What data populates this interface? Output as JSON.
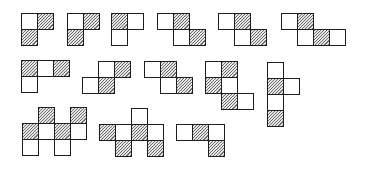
{
  "figure": {
    "cell_size": 16,
    "colors": {
      "outline": "#1e1e1e",
      "white_cell": "#ffffff",
      "hatch": "#6f6f6f"
    },
    "shapes": [
      {
        "id": 1,
        "x": 21,
        "y": 13,
        "cells": [
          {
            "c": 0,
            "r": 0,
            "h": false
          },
          {
            "c": 1,
            "r": 0,
            "h": true
          },
          {
            "c": 0,
            "r": 1,
            "h": true
          }
        ]
      },
      {
        "id": 2,
        "x": 67,
        "y": 13,
        "cells": [
          {
            "c": 0,
            "r": 0,
            "h": false
          },
          {
            "c": 1,
            "r": 0,
            "h": true
          },
          {
            "c": 0,
            "r": 1,
            "h": true
          }
        ]
      },
      {
        "id": 3,
        "x": 111,
        "y": 13,
        "cells": [
          {
            "c": 0,
            "r": 0,
            "h": true
          },
          {
            "c": 1,
            "r": 0,
            "h": false
          },
          {
            "c": 0,
            "r": 1,
            "h": false
          }
        ]
      },
      {
        "id": 4,
        "x": 157,
        "y": 13,
        "cells": [
          {
            "c": 0,
            "r": 0,
            "h": false
          },
          {
            "c": 1,
            "r": 0,
            "h": true
          },
          {
            "c": 1,
            "r": 1,
            "h": false
          },
          {
            "c": 2,
            "r": 1,
            "h": true
          }
        ]
      },
      {
        "id": 5,
        "x": 218,
        "y": 13,
        "cells": [
          {
            "c": 0,
            "r": 0,
            "h": false
          },
          {
            "c": 1,
            "r": 0,
            "h": true
          },
          {
            "c": 1,
            "r": 1,
            "h": false
          },
          {
            "c": 2,
            "r": 1,
            "h": true
          }
        ]
      },
      {
        "id": 6,
        "x": 281,
        "y": 13,
        "cells": [
          {
            "c": 0,
            "r": 0,
            "h": false
          },
          {
            "c": 1,
            "r": 0,
            "h": true
          },
          {
            "c": 1,
            "r": 1,
            "h": false
          },
          {
            "c": 2,
            "r": 1,
            "h": true
          },
          {
            "c": 3,
            "r": 1,
            "h": false
          }
        ]
      },
      {
        "id": 7,
        "x": 21,
        "y": 60,
        "cells": [
          {
            "c": 0,
            "r": 0,
            "h": true
          },
          {
            "c": 1,
            "r": 0,
            "h": false
          },
          {
            "c": 2,
            "r": 0,
            "h": true
          },
          {
            "c": 0,
            "r": 1,
            "h": false
          }
        ]
      },
      {
        "id": 8,
        "x": 82,
        "y": 61,
        "cells": [
          {
            "c": 1,
            "r": 0,
            "h": false
          },
          {
            "c": 2,
            "r": 0,
            "h": true
          },
          {
            "c": 0,
            "r": 1,
            "h": false
          },
          {
            "c": 1,
            "r": 1,
            "h": true
          }
        ]
      },
      {
        "id": 9,
        "x": 144,
        "y": 61,
        "cells": [
          {
            "c": 0,
            "r": 0,
            "h": false
          },
          {
            "c": 1,
            "r": 0,
            "h": true
          },
          {
            "c": 1,
            "r": 1,
            "h": false
          },
          {
            "c": 2,
            "r": 1,
            "h": true
          }
        ]
      },
      {
        "id": 10,
        "x": 205,
        "y": 61,
        "cells": [
          {
            "c": 0,
            "r": 0,
            "h": false
          },
          {
            "c": 1,
            "r": 0,
            "h": true
          },
          {
            "c": 0,
            "r": 1,
            "h": true
          },
          {
            "c": 1,
            "r": 1,
            "h": false
          },
          {
            "c": 1,
            "r": 2,
            "h": true
          },
          {
            "c": 2,
            "r": 2,
            "h": false
          }
        ]
      },
      {
        "id": 11,
        "x": 267,
        "y": 62,
        "cells": [
          {
            "c": 0,
            "r": 0,
            "h": false
          },
          {
            "c": 0,
            "r": 1,
            "h": true
          },
          {
            "c": 1,
            "r": 1,
            "h": false
          },
          {
            "c": 0,
            "r": 2,
            "h": false
          },
          {
            "c": 0,
            "r": 3,
            "h": true
          }
        ]
      },
      {
        "id": 12,
        "x": 22,
        "y": 107,
        "cells": [
          {
            "c": 1,
            "r": 0,
            "h": true
          },
          {
            "c": 3,
            "r": 0,
            "h": true
          },
          {
            "c": 0,
            "r": 1,
            "h": true
          },
          {
            "c": 1,
            "r": 1,
            "h": false
          },
          {
            "c": 2,
            "r": 1,
            "h": true
          },
          {
            "c": 3,
            "r": 1,
            "h": false
          },
          {
            "c": 0,
            "r": 2,
            "h": false
          },
          {
            "c": 2,
            "r": 2,
            "h": false
          }
        ]
      },
      {
        "id": 13,
        "x": 99,
        "y": 108,
        "cells": [
          {
            "c": 2,
            "r": 0,
            "h": false
          },
          {
            "c": 0,
            "r": 1,
            "h": true
          },
          {
            "c": 1,
            "r": 1,
            "h": false
          },
          {
            "c": 2,
            "r": 1,
            "h": true
          },
          {
            "c": 3,
            "r": 1,
            "h": false
          },
          {
            "c": 1,
            "r": 2,
            "h": true
          },
          {
            "c": 3,
            "r": 2,
            "h": true
          }
        ]
      },
      {
        "id": 14,
        "x": 176,
        "y": 124,
        "cells": [
          {
            "c": 0,
            "r": 0,
            "h": false
          },
          {
            "c": 1,
            "r": 0,
            "h": true
          },
          {
            "c": 2,
            "r": 0,
            "h": false
          },
          {
            "c": 2,
            "r": 1,
            "h": true
          }
        ]
      }
    ]
  }
}
